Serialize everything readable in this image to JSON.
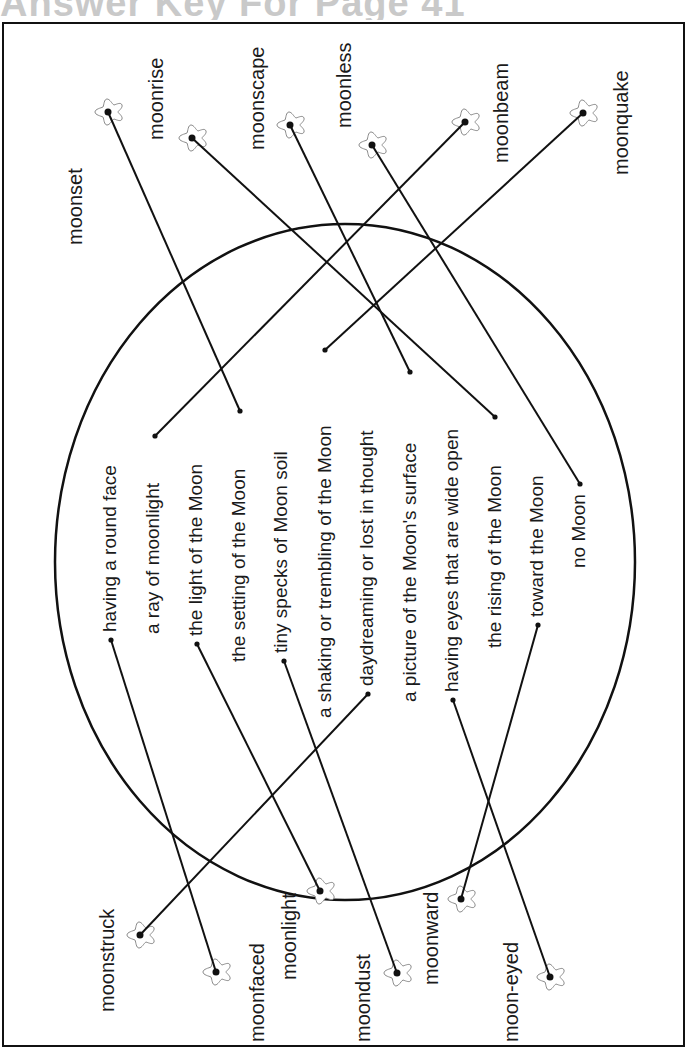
{
  "header": {
    "title": "Answer Key For Page 41"
  },
  "colors": {
    "ink": "#111111",
    "star_outline": "#8a8a8a",
    "title_gray": "#c9c9c9"
  },
  "top_words": [
    {
      "label": "moonset",
      "star": null
    },
    {
      "label": "moonrise",
      "star": [
        192,
        138
      ]
    },
    {
      "label": "moonscape",
      "star": [
        290,
        125
      ]
    },
    {
      "label": "moonless",
      "star": [
        372,
        145
      ]
    },
    {
      "label": "moonbeam",
      "star": [
        465,
        122
      ]
    },
    {
      "label": "moonquake",
      "star": [
        583,
        113
      ]
    }
  ],
  "moonset_star": [
    108,
    112
  ],
  "bottom_words": [
    {
      "label": "moonstruck",
      "star": [
        140,
        935
      ]
    },
    {
      "label": "moonfaced",
      "star": [
        216,
        972
      ]
    },
    {
      "label": "moonlight",
      "star": [
        320,
        891
      ]
    },
    {
      "label": "moondust",
      "star": [
        397,
        973
      ]
    },
    {
      "label": "moonward",
      "star": [
        461,
        899
      ]
    },
    {
      "label": "moon-eyed",
      "star": [
        550,
        977
      ]
    }
  ],
  "definitions": [
    {
      "text": "having a round face",
      "dot": [
        111,
        640
      ]
    },
    {
      "text": "a ray of moonlight",
      "dot": [
        155,
        436
      ]
    },
    {
      "text": "the light of the Moon",
      "dot": [
        197,
        644
      ]
    },
    {
      "text": "the setting of the Moon",
      "dot": [
        240,
        411
      ]
    },
    {
      "text": "tiny specks of Moon soil",
      "dot": [
        284,
        661
      ]
    },
    {
      "text": "a shaking or trembling of the Moon",
      "dot": [
        325,
        350
      ]
    },
    {
      "text": "daydreaming or lost in thought",
      "dot": [
        368,
        694
      ]
    },
    {
      "text": "a picture of the Moon's surface",
      "dot": [
        410,
        372
      ]
    },
    {
      "text": "having eyes that are wide open",
      "dot": [
        453,
        700
      ]
    },
    {
      "text": "the rising of the Moon",
      "dot": [
        495,
        417
      ]
    },
    {
      "text": "toward the Moon",
      "dot": [
        538,
        625
      ]
    },
    {
      "text": "no Moon",
      "dot": [
        580,
        484
      ]
    }
  ],
  "answers": [
    {
      "word": "moonset",
      "definition": "the setting of the Moon"
    },
    {
      "word": "moonrise",
      "definition": "the rising of the Moon"
    },
    {
      "word": "moonscape",
      "definition": "a picture of the Moon's surface"
    },
    {
      "word": "moonless",
      "definition": "no Moon"
    },
    {
      "word": "moonbeam",
      "definition": "a ray of moonlight"
    },
    {
      "word": "moonquake",
      "definition": "a shaking or trembling of the Moon"
    },
    {
      "word": "moonstruck",
      "definition": "daydreaming or lost in thought"
    },
    {
      "word": "moonfaced",
      "definition": "having a round face"
    },
    {
      "word": "moonlight",
      "definition": "the light of the Moon"
    },
    {
      "word": "moondust",
      "definition": "tiny specks of Moon soil"
    },
    {
      "word": "moonward",
      "definition": "toward the Moon"
    },
    {
      "word": "moon-eyed",
      "definition": "having eyes that are wide open"
    }
  ],
  "circle": {
    "cx": 345,
    "cy": 562,
    "rx": 290,
    "ry": 338
  }
}
